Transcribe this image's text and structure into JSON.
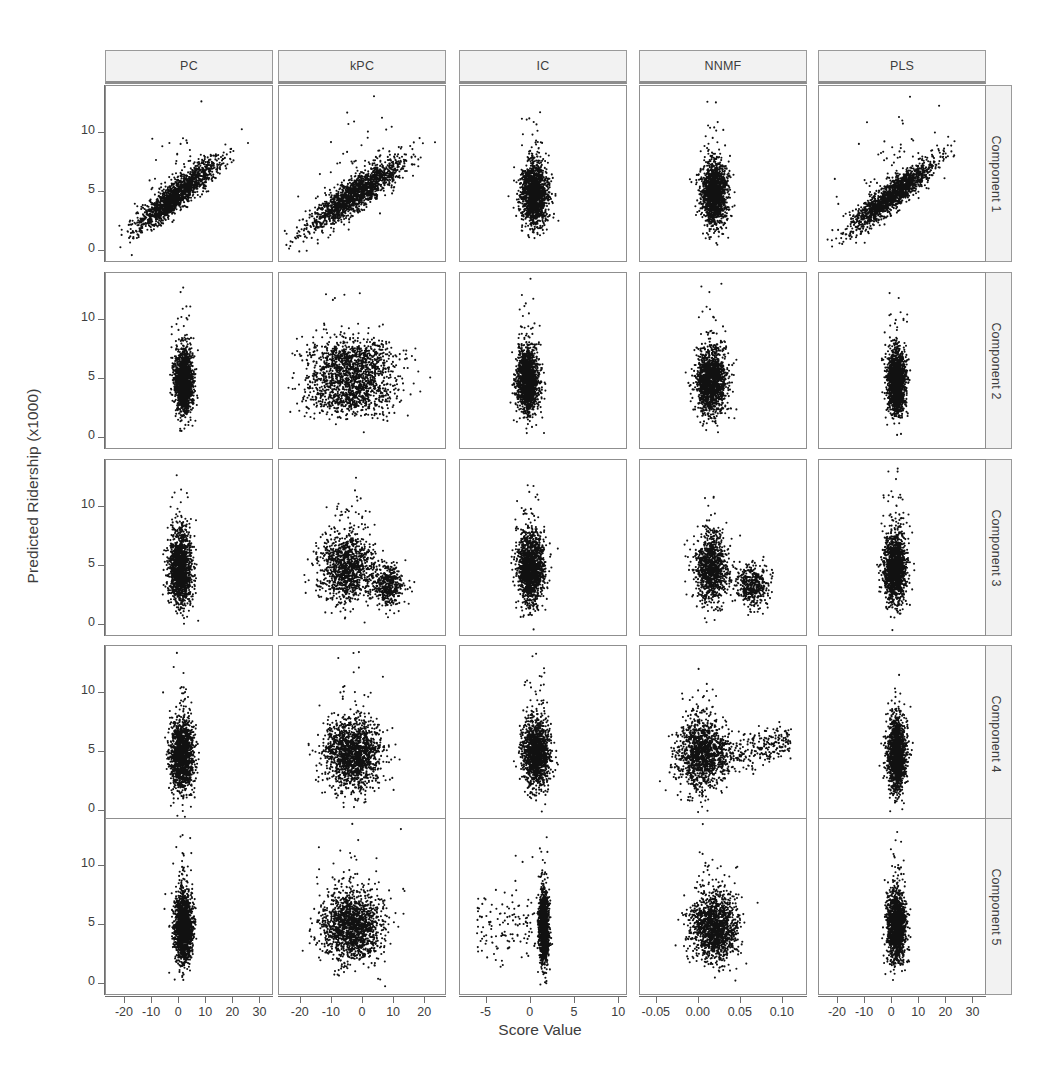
{
  "figure": {
    "type": "scatterplot-matrix",
    "xlabel": "Score Value",
    "ylabel": "Predicted Ridership (x1000)"
  },
  "columns": [
    {
      "label": "PC",
      "xticks": [
        "-20",
        "-10",
        "0",
        "10",
        "20",
        "30"
      ],
      "xlim": [
        -27,
        35
      ]
    },
    {
      "label": "kPC",
      "xticks": [
        "-20",
        "-10",
        "0",
        "10",
        "20"
      ],
      "xlim": [
        -27,
        27
      ]
    },
    {
      "label": "IC",
      "xticks": [
        "-5",
        "0",
        "5",
        "10"
      ],
      "xlim": [
        -8,
        11
      ]
    },
    {
      "label": "NNMF",
      "xticks": [
        "-0.05",
        "0.00",
        "0.05",
        "0.10"
      ],
      "xlim": [
        -0.07,
        0.13
      ]
    },
    {
      "label": "PLS",
      "xticks": [
        "-20",
        "-10",
        "0",
        "10",
        "20",
        "30"
      ],
      "xlim": [
        -27,
        35
      ]
    }
  ],
  "rows": [
    {
      "label": "Component 1",
      "yticks": [
        "0",
        "5",
        "10"
      ],
      "ylim": [
        -1,
        14
      ]
    },
    {
      "label": "Component 2",
      "yticks": [
        "0",
        "5",
        "10"
      ],
      "ylim": [
        -1,
        14
      ]
    },
    {
      "label": "Component 3",
      "yticks": [
        "0",
        "5",
        "10"
      ],
      "ylim": [
        -1,
        14
      ]
    },
    {
      "label": "Component 4",
      "yticks": [
        "0",
        "5",
        "10"
      ],
      "ylim": [
        -1,
        14
      ]
    },
    {
      "label": "Component 5",
      "yticks": [
        "0",
        "5",
        "10"
      ],
      "ylim": [
        -1,
        14
      ]
    }
  ],
  "chart_data": {
    "type": "scatter",
    "title": "",
    "xlabel": "Score Value",
    "ylabel": "Predicted Ridership (x1000)",
    "grid": false,
    "legend": null,
    "point_color": "#111111",
    "point_size_px": 2.0,
    "n_points_per_panel": 1500,
    "col_labels": [
      "PC",
      "kPC",
      "IC",
      "NNMF",
      "PLS"
    ],
    "row_labels": [
      "Component 1",
      "Component 2",
      "Component 3",
      "Component 4",
      "Component 5"
    ],
    "x_tick_labels": [
      [
        "-20",
        "-10",
        "0",
        "10",
        "20",
        "30"
      ],
      [
        "-20",
        "-10",
        "0",
        "10",
        "20"
      ],
      [
        "-5",
        "0",
        "5",
        "10"
      ],
      [
        "-0.05",
        "0.00",
        "0.05",
        "0.10"
      ],
      [
        "-20",
        "-10",
        "0",
        "10",
        "20",
        "30"
      ]
    ],
    "y_tick_labels": [
      "0",
      "5",
      "10"
    ],
    "ylim": [
      -1,
      14
    ],
    "xlims": [
      [
        -27,
        35
      ],
      [
        -27,
        27
      ],
      [
        -8,
        11
      ],
      [
        -0.07,
        0.13
      ],
      [
        -27,
        35
      ]
    ],
    "panels": [
      {
        "row": "Component 1",
        "col": "PC",
        "shape": "diagonal-positive",
        "corr": 0.82,
        "x_center": 0.42,
        "x_spread": 0.2,
        "y_center": 0.38,
        "y_spread": 0.16,
        "n": 1600
      },
      {
        "row": "Component 1",
        "col": "kPC",
        "shape": "diagonal-positive",
        "corr": 0.8,
        "x_center": 0.45,
        "x_spread": 0.24,
        "y_center": 0.38,
        "y_spread": 0.17,
        "n": 1700
      },
      {
        "row": "Component 1",
        "col": "IC",
        "shape": "vertical-blob",
        "corr": 0.1,
        "x_center": 0.44,
        "x_spread": 0.07,
        "y_center": 0.38,
        "y_spread": 0.15,
        "n": 1500
      },
      {
        "row": "Component 1",
        "col": "NNMF",
        "shape": "vertical-blob",
        "corr": 0.08,
        "x_center": 0.44,
        "x_spread": 0.07,
        "y_center": 0.38,
        "y_spread": 0.15,
        "n": 1500
      },
      {
        "row": "Component 1",
        "col": "PLS",
        "shape": "diagonal-positive",
        "corr": 0.84,
        "x_center": 0.44,
        "x_spread": 0.21,
        "y_center": 0.38,
        "y_spread": 0.16,
        "n": 1600
      },
      {
        "row": "Component 2",
        "col": "PC",
        "shape": "vertical-blob",
        "corr": 0.02,
        "x_center": 0.46,
        "x_spread": 0.05,
        "y_center": 0.38,
        "y_spread": 0.15,
        "n": 1500
      },
      {
        "row": "Component 2",
        "col": "kPC",
        "shape": "horizontal-bands",
        "corr": 0.05,
        "x_center": 0.38,
        "x_spread": 0.22,
        "y_center": 0.38,
        "y_spread": 0.17,
        "n": 1700
      },
      {
        "row": "Component 2",
        "col": "IC",
        "shape": "vertical-blob",
        "corr": 0.04,
        "x_center": 0.4,
        "x_spread": 0.06,
        "y_center": 0.38,
        "y_spread": 0.15,
        "n": 1500
      },
      {
        "row": "Component 2",
        "col": "NNMF",
        "shape": "vertical-blob",
        "corr": 0.06,
        "x_center": 0.42,
        "x_spread": 0.08,
        "y_center": 0.38,
        "y_spread": 0.16,
        "n": 1500
      },
      {
        "row": "Component 2",
        "col": "PLS",
        "shape": "vertical-blob",
        "corr": 0.02,
        "x_center": 0.46,
        "x_spread": 0.05,
        "y_center": 0.38,
        "y_spread": 0.15,
        "n": 1500
      },
      {
        "row": "Component 3",
        "col": "PC",
        "shape": "vertical-blob",
        "corr": 0.03,
        "x_center": 0.44,
        "x_spread": 0.06,
        "y_center": 0.38,
        "y_spread": 0.16,
        "n": 1500
      },
      {
        "row": "Component 3",
        "col": "kPC",
        "shape": "cluster-split",
        "corr": 0.05,
        "x_center": 0.4,
        "x_spread": 0.16,
        "y_center": 0.38,
        "y_spread": 0.16,
        "n": 1600
      },
      {
        "row": "Component 3",
        "col": "IC",
        "shape": "vertical-blob",
        "corr": 0.05,
        "x_center": 0.42,
        "x_spread": 0.07,
        "y_center": 0.38,
        "y_spread": 0.16,
        "n": 1500
      },
      {
        "row": "Component 3",
        "col": "NNMF",
        "shape": "cluster-split",
        "corr": 0.05,
        "x_center": 0.42,
        "x_spread": 0.1,
        "y_center": 0.38,
        "y_spread": 0.16,
        "n": 1500
      },
      {
        "row": "Component 3",
        "col": "PLS",
        "shape": "vertical-blob",
        "corr": 0.03,
        "x_center": 0.45,
        "x_spread": 0.06,
        "y_center": 0.38,
        "y_spread": 0.16,
        "n": 1500
      },
      {
        "row": "Component 4",
        "col": "PC",
        "shape": "vertical-blob",
        "corr": 0.02,
        "x_center": 0.45,
        "x_spread": 0.06,
        "y_center": 0.38,
        "y_spread": 0.17,
        "n": 1500
      },
      {
        "row": "Component 4",
        "col": "kPC",
        "shape": "wide-blob",
        "corr": 0.04,
        "x_center": 0.44,
        "x_spread": 0.14,
        "y_center": 0.38,
        "y_spread": 0.16,
        "n": 1600
      },
      {
        "row": "Component 4",
        "col": "IC",
        "shape": "vertical-blob",
        "corr": 0.04,
        "x_center": 0.45,
        "x_spread": 0.07,
        "y_center": 0.38,
        "y_spread": 0.16,
        "n": 1500
      },
      {
        "row": "Component 4",
        "col": "NNMF",
        "shape": "fan-right",
        "corr": 0.12,
        "x_center": 0.36,
        "x_spread": 0.13,
        "y_center": 0.38,
        "y_spread": 0.16,
        "n": 1600
      },
      {
        "row": "Component 4",
        "col": "PLS",
        "shape": "vertical-blob",
        "corr": 0.02,
        "x_center": 0.46,
        "x_spread": 0.05,
        "y_center": 0.38,
        "y_spread": 0.17,
        "n": 1500
      },
      {
        "row": "Component 5",
        "col": "PC",
        "shape": "vertical-blob",
        "corr": 0.01,
        "x_center": 0.46,
        "x_spread": 0.05,
        "y_center": 0.38,
        "y_spread": 0.16,
        "n": 1500
      },
      {
        "row": "Component 5",
        "col": "kPC",
        "shape": "wide-blob",
        "corr": 0.03,
        "x_center": 0.43,
        "x_spread": 0.15,
        "y_center": 0.38,
        "y_spread": 0.16,
        "n": 1600
      },
      {
        "row": "Component 5",
        "col": "IC",
        "shape": "vertical-spike",
        "corr": 0.02,
        "x_center": 0.5,
        "x_spread": 0.03,
        "y_center": 0.38,
        "y_spread": 0.16,
        "n": 1500
      },
      {
        "row": "Component 5",
        "col": "NNMF",
        "shape": "wide-blob",
        "corr": 0.03,
        "x_center": 0.44,
        "x_spread": 0.12,
        "y_center": 0.38,
        "y_spread": 0.16,
        "n": 1500
      },
      {
        "row": "Component 5",
        "col": "PLS",
        "shape": "vertical-blob",
        "corr": 0.01,
        "x_center": 0.46,
        "x_spread": 0.05,
        "y_center": 0.38,
        "y_spread": 0.16,
        "n": 1500
      }
    ]
  },
  "layout": {
    "panel_left": [
      105,
      278,
      459,
      639,
      818
    ],
    "panel_top": [
      85,
      272,
      459,
      645,
      818
    ],
    "panel_width": 168,
    "panel_height": 177,
    "strip_top": 50,
    "rowstrip_left": 978
  }
}
